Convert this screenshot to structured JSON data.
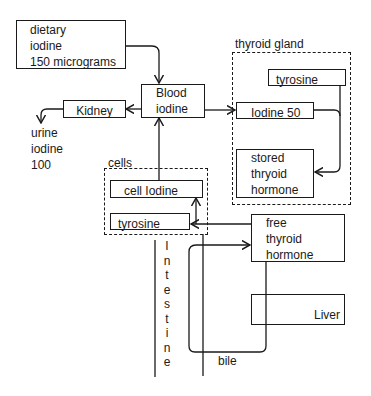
{
  "diagram": {
    "nodes": {
      "dietary": {
        "lines": [
          "dietary",
          "iodine",
          "150 micrograms"
        ]
      },
      "blood": {
        "lines": [
          "Blood",
          "iodine"
        ]
      },
      "kidney": {
        "label": "Kidney"
      },
      "urine": {
        "lines": [
          "urine",
          "iodine",
          "100"
        ]
      },
      "thyroid_gland": {
        "label": "thyroid gland"
      },
      "thyroid_tyrosine": {
        "label": "tyrosine"
      },
      "iodine50": {
        "label": "Iodine 50"
      },
      "stored": {
        "lines": [
          "stored",
          "thryoid",
          "hormone"
        ]
      },
      "cells": {
        "label": "cells"
      },
      "cell_iodine": {
        "label": "cell Iodine"
      },
      "cell_tyrosine": {
        "label": "tyrosine"
      },
      "free": {
        "lines": [
          "free",
          "thyroid",
          "hormone"
        ]
      },
      "liver": {
        "label": "Liver"
      },
      "intestine": {
        "letters": [
          "I",
          "n",
          "t",
          "e",
          "s",
          "t",
          "i",
          "n",
          "e"
        ]
      },
      "bile": {
        "label": "bile"
      }
    },
    "edges": [
      {
        "from": "dietary iodine",
        "to": "Blood iodine"
      },
      {
        "from": "Blood iodine",
        "to": "Kidney"
      },
      {
        "from": "Kidney",
        "to": "urine iodine"
      },
      {
        "from": "Blood iodine",
        "to": "Iodine 50"
      },
      {
        "from": "tyrosine (thyroid)",
        "to": "stored thryoid hormone"
      },
      {
        "from": "Iodine 50",
        "to": "stored thryoid hormone"
      },
      {
        "from": "cell Iodine",
        "to": "Blood iodine"
      },
      {
        "from": "free thyroid hormone",
        "to": "tyrosine (cells)"
      },
      {
        "from": "free thyroid hormone",
        "to": "cell Iodine"
      },
      {
        "from": "Liver",
        "to": "bile"
      },
      {
        "from": "bile",
        "to": "free thyroid hormone"
      }
    ]
  }
}
